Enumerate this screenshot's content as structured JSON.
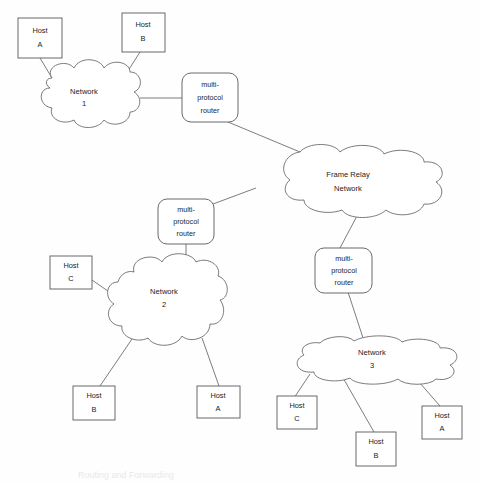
{
  "diagram": {
    "background_color": "#fefefe",
    "line_color": "#6e6e6e",
    "text_color": "#1c1c1c",
    "partial_caption": "Routing and Forwarding"
  },
  "clouds": [
    {
      "id": "network-1",
      "line1": "Network",
      "line2": "1"
    },
    {
      "id": "frame-relay",
      "line1": "Frame Relay",
      "line2": "Network"
    },
    {
      "id": "network-2",
      "line1": "Network",
      "line2": "2"
    },
    {
      "id": "network-3",
      "line1": "Network",
      "line2": "3"
    }
  ],
  "routers": [
    {
      "id": "router-1",
      "line1": "multi-",
      "line2": "protocol",
      "line3": "router"
    },
    {
      "id": "router-2",
      "line1": "multi-",
      "line2": "protocol",
      "line3": "router"
    },
    {
      "id": "router-3",
      "line1": "multi-",
      "line2": "protocol",
      "line3": "router"
    }
  ],
  "hosts": [
    {
      "id": "net1-host-a",
      "line1": "Host",
      "line2": "A"
    },
    {
      "id": "net1-host-b",
      "line1": "Host",
      "line2": "B"
    },
    {
      "id": "net2-host-c",
      "line1": "Host",
      "line2": "C"
    },
    {
      "id": "net2-host-b",
      "line1": "Host",
      "line2": "B"
    },
    {
      "id": "net2-host-a",
      "line1": "Host",
      "line2": "A"
    },
    {
      "id": "net3-host-c",
      "line1": "Host",
      "line2": "C"
    },
    {
      "id": "net3-host-b",
      "line1": "Host",
      "line2": "B"
    },
    {
      "id": "net3-host-a",
      "line1": "Host",
      "line2": "A"
    }
  ]
}
